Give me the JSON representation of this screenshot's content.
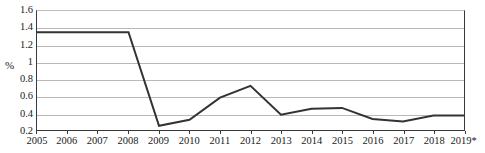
{
  "chart_data": {
    "type": "line",
    "title": "",
    "subtitle": "",
    "xlabel": "",
    "ylabel": "%",
    "categories": [
      "2005",
      "2006",
      "2007",
      "2008",
      "2009",
      "2010",
      "2011",
      "2012",
      "2013",
      "2014",
      "2015",
      "2016",
      "2017",
      "2018",
      "2019*"
    ],
    "values": [
      1.35,
      1.35,
      1.35,
      1.35,
      0.25,
      0.32,
      0.58,
      0.72,
      0.38,
      0.45,
      0.46,
      0.33,
      0.3,
      0.37,
      0.37
    ],
    "series": [
      {
        "name": "",
        "values": [
          1.35,
          1.35,
          1.35,
          1.35,
          0.25,
          0.32,
          0.58,
          0.72,
          0.38,
          0.45,
          0.46,
          0.33,
          0.3,
          0.37,
          0.37
        ]
      }
    ],
    "ylim": [
      0.2,
      1.6
    ],
    "ytick_labels": [
      "1.6",
      "1.4",
      "1.2",
      "1",
      "0.8",
      "0.6",
      "0.4",
      "0.2"
    ],
    "ytick_values": [
      1.6,
      1.4,
      1.2,
      1.0,
      0.8,
      0.6,
      0.4,
      0.2
    ],
    "xtick_labels": [
      "2005",
      "2006",
      "2007",
      "2008",
      "2009",
      "2010",
      "2011",
      "2012",
      "2013",
      "2014",
      "2015",
      "2016",
      "2017",
      "2018",
      "2019*"
    ],
    "grid": true,
    "grid_axis": "y",
    "legend": false,
    "legend_position": "none",
    "line_color": "#333333",
    "grid_color": "#b9b9b9",
    "axis_color": "#3a3a3a",
    "background_color": "#ffffff",
    "annotations": [
      "* denotes estimated or projected value for 2019"
    ]
  }
}
